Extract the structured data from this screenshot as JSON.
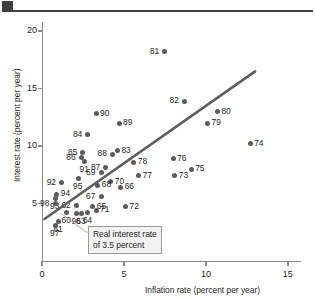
{
  "figure": {
    "header_accent_color": "#3f3f3f",
    "point_color": "#5a5a5a",
    "line_color": "#5e5e5e",
    "axis_color": "#8c8c8c"
  },
  "annotation": {
    "line1": "Real interest rate",
    "line2": "of 3.5 percent"
  },
  "chart_data": {
    "type": "scatter",
    "title": "",
    "xlabel": "Inflation rate (percent per year)",
    "ylabel": "Interest rate (percent per year)",
    "xlim": [
      0,
      15.8
    ],
    "ylim": [
      0,
      20.8
    ],
    "xticks": [
      0,
      5,
      10,
      15
    ],
    "xticklabels": [
      "0",
      "5",
      "10",
      "15"
    ],
    "yticks": [
      5,
      10,
      15,
      20
    ],
    "yticklabels": [
      "5",
      "10",
      "15",
      "20"
    ],
    "grid": false,
    "legend": null,
    "annotations": [
      {
        "text": "Real interest rate of 3.5 percent",
        "points_to": "regression line"
      }
    ],
    "trendline": {
      "label": "Real interest rate of 3.5 percent",
      "intercept": 3.5,
      "slope": 1.0,
      "x_start": 0.15,
      "y_start": 3.65,
      "x_end": 13.0,
      "y_end": 16.5
    },
    "point_label_field": "year",
    "points": [
      {
        "year": "81",
        "x": 7.5,
        "y": 18.2,
        "label_side": "left"
      },
      {
        "year": "82",
        "x": 8.7,
        "y": 13.9,
        "label_side": "left"
      },
      {
        "year": "80",
        "x": 10.7,
        "y": 13.0,
        "label_side": "right"
      },
      {
        "year": "79",
        "x": 10.1,
        "y": 12.0,
        "label_side": "right"
      },
      {
        "year": "90",
        "x": 3.3,
        "y": 12.8,
        "label_side": "right"
      },
      {
        "year": "89",
        "x": 4.7,
        "y": 12.0,
        "label_side": "right"
      },
      {
        "year": "84",
        "x": 2.8,
        "y": 11.0,
        "label_side": "left"
      },
      {
        "year": "74",
        "x": 12.7,
        "y": 10.2,
        "label_side": "right"
      },
      {
        "year": "83",
        "x": 4.6,
        "y": 9.6,
        "label_side": "right"
      },
      {
        "year": "88",
        "x": 4.3,
        "y": 9.3,
        "label_side": "left"
      },
      {
        "year": "85",
        "x": 2.5,
        "y": 9.4,
        "label_side": "left"
      },
      {
        "year": "86",
        "x": 2.4,
        "y": 9.0,
        "label_side": "left"
      },
      {
        "year": "91",
        "x": 2.6,
        "y": 8.7,
        "label_side": "below"
      },
      {
        "year": "76",
        "x": 8.0,
        "y": 8.9,
        "label_side": "right"
      },
      {
        "year": "78",
        "x": 5.6,
        "y": 8.6,
        "label_side": "right"
      },
      {
        "year": "87",
        "x": 3.9,
        "y": 8.1,
        "label_side": "left"
      },
      {
        "year": "69",
        "x": 3.6,
        "y": 7.7,
        "label_side": "left"
      },
      {
        "year": "75",
        "x": 9.1,
        "y": 8.0,
        "label_side": "right"
      },
      {
        "year": "77",
        "x": 5.9,
        "y": 7.4,
        "label_side": "right"
      },
      {
        "year": "73",
        "x": 8.1,
        "y": 7.4,
        "label_side": "right"
      },
      {
        "year": "92",
        "x": 1.2,
        "y": 6.8,
        "label_side": "left"
      },
      {
        "year": "95",
        "x": 2.2,
        "y": 7.2,
        "label_side": "below"
      },
      {
        "year": "70",
        "x": 4.2,
        "y": 6.9,
        "label_side": "right"
      },
      {
        "year": "68",
        "x": 3.4,
        "y": 6.6,
        "label_side": "right"
      },
      {
        "year": "66",
        "x": 4.8,
        "y": 6.4,
        "label_side": "right"
      },
      {
        "year": "94",
        "x": 0.9,
        "y": 5.8,
        "label_side": "right"
      },
      {
        "year": "93",
        "x": 0.8,
        "y": 5.4,
        "label_side": "below"
      },
      {
        "year": "67",
        "x": 3.6,
        "y": 5.6,
        "label_side": "left"
      },
      {
        "year": "98",
        "x": 0.8,
        "y": 5.0,
        "label_side": "left"
      },
      {
        "year": "62",
        "x": 2.1,
        "y": 4.8,
        "label_side": "left"
      },
      {
        "year": "65",
        "x": 3.1,
        "y": 4.7,
        "label_side": "right"
      },
      {
        "year": "72",
        "x": 5.1,
        "y": 4.7,
        "label_side": "right"
      },
      {
        "year": "60",
        "x": 1.5,
        "y": 4.2,
        "label_side": "below"
      },
      {
        "year": "96",
        "x": 2.1,
        "y": 4.1,
        "label_side": "below"
      },
      {
        "year": "63",
        "x": 2.4,
        "y": 4.1,
        "label_side": "below"
      },
      {
        "year": "64",
        "x": 2.8,
        "y": 4.2,
        "label_side": "below"
      },
      {
        "year": "71",
        "x": 3.3,
        "y": 4.4,
        "label_side": "right"
      },
      {
        "year": "61",
        "x": 1.0,
        "y": 3.4,
        "label_side": "below"
      },
      {
        "year": "97",
        "x": 0.8,
        "y": 3.1,
        "label_side": "below"
      }
    ]
  }
}
